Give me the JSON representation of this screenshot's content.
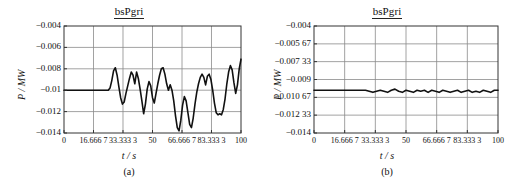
{
  "figure": {
    "panels": [
      {
        "caption": "(a)",
        "title": "bsPgri",
        "ylabel": "P / MW",
        "xlabel": "t / s"
      },
      {
        "caption": "(b)",
        "title": "bsPgri",
        "ylabel": "P / MW",
        "xlabel": "t / s"
      }
    ]
  },
  "chart_data": [
    {
      "type": "line",
      "title": "bsPgri",
      "caption": "(a)",
      "xlabel": "t / s",
      "ylabel": "P / MW",
      "xlim": [
        0,
        100
      ],
      "ylim": [
        -0.014,
        -0.004
      ],
      "grid": true,
      "legend": "none",
      "xticks": [
        0,
        16.6667,
        33.3333,
        50,
        66.6667,
        83.3333,
        100
      ],
      "xticklabels": [
        "0",
        "16.666 7",
        "33.333 3",
        "50",
        "66.666 7",
        "83.333 3",
        "100"
      ],
      "yticks": [
        -0.004,
        -0.006,
        -0.008,
        -0.01,
        -0.012,
        -0.014
      ],
      "yticklabels": [
        "−0.004",
        "−0.006",
        "−0.008",
        "−0.01",
        "−0.012",
        "−0.014"
      ],
      "series": [
        {
          "name": "bsPgri",
          "x": [
            0,
            2,
            4,
            6,
            8,
            10,
            12,
            14,
            16,
            18,
            20,
            22,
            24,
            25,
            26,
            27,
            28,
            29,
            30,
            31,
            32,
            33,
            34,
            35,
            36,
            37,
            38,
            39,
            40,
            41,
            42,
            43,
            44,
            45,
            46,
            47,
            48,
            49,
            50,
            51,
            52,
            53,
            54,
            55,
            56,
            57,
            58,
            59,
            60,
            61,
            62,
            63,
            64,
            65,
            66,
            67,
            68,
            69,
            70,
            71,
            72,
            73,
            74,
            75,
            76,
            77,
            78,
            79,
            80,
            81,
            82,
            83,
            84,
            85,
            86,
            87,
            88,
            89,
            90,
            91,
            92,
            93,
            94,
            95,
            96,
            97,
            98,
            99,
            100
          ],
          "y": [
            -0.01,
            -0.01,
            -0.01,
            -0.01,
            -0.01,
            -0.01,
            -0.01,
            -0.01,
            -0.01,
            -0.01,
            -0.01,
            -0.01,
            -0.01,
            -0.01,
            -0.0098,
            -0.0091,
            -0.0082,
            -0.0079,
            -0.0086,
            -0.0097,
            -0.0107,
            -0.0113,
            -0.0111,
            -0.0103,
            -0.0096,
            -0.0089,
            -0.0083,
            -0.0086,
            -0.0094,
            -0.0083,
            -0.0089,
            -0.0099,
            -0.011,
            -0.0122,
            -0.0113,
            -0.0099,
            -0.0092,
            -0.0096,
            -0.0107,
            -0.0112,
            -0.0103,
            -0.0094,
            -0.0086,
            -0.008,
            -0.0079,
            -0.0085,
            -0.0094,
            -0.01,
            -0.0095,
            -0.01,
            -0.011,
            -0.0124,
            -0.0135,
            -0.0138,
            -0.0128,
            -0.0114,
            -0.0106,
            -0.011,
            -0.0121,
            -0.0132,
            -0.0135,
            -0.0126,
            -0.0113,
            -0.0102,
            -0.0094,
            -0.0088,
            -0.0085,
            -0.0088,
            -0.0095,
            -0.0087,
            -0.0085,
            -0.009,
            -0.01,
            -0.0112,
            -0.0121,
            -0.0123,
            -0.0122,
            -0.0123,
            -0.0118,
            -0.0108,
            -0.0094,
            -0.0083,
            -0.0077,
            -0.0081,
            -0.0093,
            -0.0103,
            -0.0095,
            -0.008,
            -0.0071,
            -0.006,
            -0.0058,
            -0.0067,
            -0.0081,
            -0.0091,
            -0.0085,
            -0.0078,
            -0.008,
            -0.0088,
            -0.0086
          ]
        }
      ]
    },
    {
      "type": "line",
      "title": "bsPgri",
      "caption": "(b)",
      "xlabel": "t / s",
      "ylabel": "P / MW",
      "xlim": [
        0,
        100
      ],
      "ylim": [
        -0.014,
        -0.004
      ],
      "grid": true,
      "legend": "none",
      "xticks": [
        0,
        16.6667,
        33.3333,
        50,
        66.6667,
        83.3333,
        100
      ],
      "xticklabels": [
        "0",
        "16.666 7",
        "33.333 3",
        "50",
        "66.666 7",
        "83.333 3",
        "100"
      ],
      "yticks": [
        -0.004,
        -0.00567,
        -0.00733,
        -0.009,
        -0.01067,
        -0.01233,
        -0.014
      ],
      "yticklabels": [
        "−0.004",
        "−0.005 67",
        "−0.007 33",
        "−0.009",
        "−0.010 67",
        "−0.012 33",
        "−0.014"
      ],
      "series": [
        {
          "name": "bsPgri",
          "x": [
            0,
            4,
            8,
            12,
            16,
            20,
            24,
            28,
            30,
            32,
            34,
            36,
            38,
            40,
            42,
            44,
            46,
            48,
            50,
            52,
            54,
            56,
            58,
            60,
            62,
            64,
            66,
            68,
            70,
            72,
            74,
            76,
            78,
            80,
            82,
            84,
            86,
            88,
            90,
            92,
            94,
            96,
            98,
            100
          ],
          "y": [
            -0.01,
            -0.01,
            -0.01,
            -0.01,
            -0.01,
            -0.01,
            -0.01,
            -0.01,
            -0.0101,
            -0.0102,
            -0.0101,
            -0.01,
            -0.0101,
            -0.0102,
            -0.01,
            -0.0099,
            -0.0101,
            -0.0102,
            -0.01,
            -0.0101,
            -0.0102,
            -0.01,
            -0.0101,
            -0.01,
            -0.0102,
            -0.01,
            -0.0101,
            -0.0102,
            -0.01,
            -0.0101,
            -0.0102,
            -0.0101,
            -0.01,
            -0.0102,
            -0.0101,
            -0.01,
            -0.0102,
            -0.0101,
            -0.0102,
            -0.01,
            -0.0101,
            -0.0102,
            -0.01,
            -0.01
          ]
        }
      ]
    }
  ],
  "style": {
    "line_color": "#111111",
    "grid_color": "#8a8a8a",
    "axis_color": "#333333",
    "background": "#ffffff"
  }
}
